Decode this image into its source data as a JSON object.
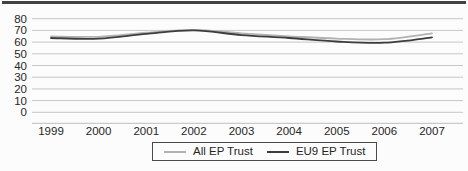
{
  "figure": {
    "top_rule_color": "#424242",
    "background": "#fcfcfc",
    "text_color": "#262626",
    "gridline_color": "#c6c6c6",
    "axis_line_color": "#bdbdbd"
  },
  "chart_data": {
    "type": "line",
    "x": [
      1999,
      2000,
      2001,
      2002,
      2003,
      2004,
      2005,
      2006,
      2007
    ],
    "series": [
      {
        "name": "All EP Trust",
        "color": "#b2b2b2",
        "values": [
          65,
          64.5,
          68,
          70.5,
          67.5,
          65,
          63,
          62.5,
          67.5
        ]
      },
      {
        "name": "EU9 EP Trust",
        "color": "#3d3d3d",
        "values": [
          63.5,
          63,
          67,
          70,
          66,
          63.5,
          60.5,
          59.5,
          64
        ]
      }
    ],
    "title": "",
    "xlabel": "",
    "ylabel": "",
    "ylim": [
      0,
      80
    ],
    "yticks": [
      0,
      10,
      20,
      30,
      40,
      50,
      60,
      70,
      80
    ],
    "grid": true,
    "legend_position": "bottom-center"
  }
}
